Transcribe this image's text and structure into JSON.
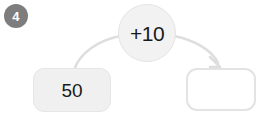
{
  "exercise": {
    "number_badge": "4",
    "type": "number-machine"
  },
  "colors": {
    "badge_fill": "#7d7d7d",
    "badge_text": "#ffffff",
    "bubble_fill": "#f2f2f2",
    "bubble_border": "#e4e4e4",
    "start_box_fill": "#f0f0f0",
    "start_box_border": "#e6e6e6",
    "answer_box_fill": "#ffffff",
    "answer_box_border": "#e3e3e3",
    "arrow_stroke": "#dedede",
    "text": "#1a1a1a"
  },
  "operator": {
    "label": "+10",
    "sign": "+",
    "amount": "10"
  },
  "boxes": [
    {
      "role": "start-value",
      "value": "50",
      "filled": true
    },
    {
      "role": "answer-value",
      "value": "",
      "filled": false
    }
  ],
  "arrows": [
    {
      "name": "arrow-from-start-to-operator",
      "has_arrowhead": false,
      "direction": "left-box-up-to-bubble"
    },
    {
      "name": "arrow-from-operator-to-answer",
      "has_arrowhead": true,
      "direction": "bubble-down-to-right-box"
    }
  ]
}
